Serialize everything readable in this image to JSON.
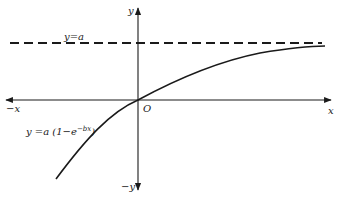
{
  "diagram": {
    "type": "function-graph",
    "axes": {
      "x_positive_label": "x",
      "x_negative_label": "−x",
      "y_positive_label": "y",
      "y_negative_label": "−y",
      "origin_label": "O"
    },
    "asymptote": {
      "label": "y=a",
      "style": "dashed"
    },
    "curve": {
      "label_prefix": "y =a (1−e",
      "label_exponent": "−bx",
      "label_suffix": ")",
      "equation": "y = a(1 − e^(−bx))"
    },
    "colors": {
      "stroke": "#1a1a1a",
      "background": "#ffffff"
    }
  }
}
